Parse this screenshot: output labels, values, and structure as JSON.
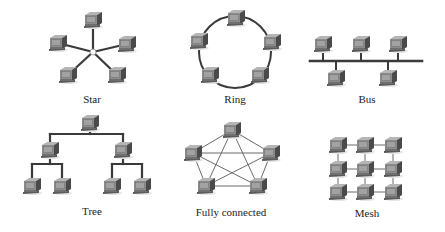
{
  "colors": {
    "link": "#3a3a3a",
    "thin_link": "#6a6a6a",
    "monitor_front": "#8c8c8c",
    "monitor_side": "#4a4a4a",
    "monitor_top": "#b5b5b5",
    "screen": "#9a9a9a",
    "hub": "#ffffff"
  },
  "topologies": [
    {
      "id": "star",
      "label": "Star",
      "label_pos": [
        92,
        93
      ],
      "hub": [
        93,
        52
      ],
      "nodes": [
        [
          93,
          20
        ],
        [
          58,
          43
        ],
        [
          127,
          44
        ],
        [
          68,
          75
        ],
        [
          117,
          75
        ]
      ],
      "links": "hub"
    },
    {
      "id": "ring",
      "label": "Ring",
      "label_pos": [
        235,
        93
      ],
      "circle": {
        "cx": 235,
        "cy": 52,
        "r": 36
      },
      "nodes": [
        [
          236,
          18
        ],
        [
          199,
          41
        ],
        [
          272,
          42
        ],
        [
          210,
          75
        ],
        [
          260,
          75
        ]
      ],
      "links": "ring"
    },
    {
      "id": "bus",
      "label": "Bus",
      "label_pos": [
        367,
        93
      ],
      "bus_line": {
        "x1": 310,
        "x2": 422,
        "y": 61
      },
      "nodes_top": [
        [
          323,
          44
        ],
        [
          361,
          44
        ],
        [
          398,
          44
        ]
      ],
      "nodes_bottom": [
        [
          336,
          78
        ],
        [
          388,
          78
        ]
      ],
      "links": "bus"
    },
    {
      "id": "tree",
      "label": "Tree",
      "label_pos": [
        92,
        205
      ],
      "root": [
        90,
        123
      ],
      "mid": [
        [
          50,
          150
        ],
        [
          123,
          150
        ]
      ],
      "leaves": [
        [
          32,
          186
        ],
        [
          62,
          186
        ],
        [
          112,
          186
        ],
        [
          142,
          186
        ]
      ],
      "links": "tree"
    },
    {
      "id": "fully-connected",
      "label": "Fully connected",
      "label_pos": [
        231,
        206
      ],
      "nodes": [
        [
          232,
          130
        ],
        [
          193,
          153
        ],
        [
          271,
          153
        ],
        [
          206,
          186
        ],
        [
          258,
          186
        ]
      ],
      "links": "all"
    },
    {
      "id": "mesh",
      "label": "Mesh",
      "label_pos": [
        367,
        207
      ],
      "grid_x": [
        338,
        365,
        393
      ],
      "grid_y": [
        145,
        169,
        192
      ],
      "links": "grid"
    }
  ]
}
